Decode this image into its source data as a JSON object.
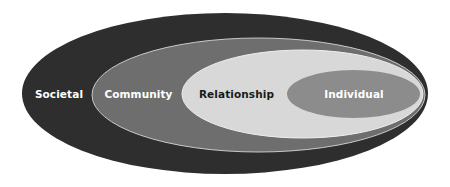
{
  "diagram": {
    "type": "nested-ellipses",
    "levels": [
      {
        "name": "societal",
        "label": "Societal",
        "fill": "#2e2e2e",
        "text_color": "#ffffff",
        "ellipse": {
          "cx": 225,
          "cy": 93.5,
          "rx": 203,
          "ry": 80.5
        },
        "label_pos": {
          "x": 59,
          "y": 97.5
        }
      },
      {
        "name": "community",
        "label": "Community",
        "fill": "#6e6e6e",
        "stroke": "#c8c8c8",
        "text_color": "#ffffff",
        "ellipse": {
          "cx": 258.5,
          "cy": 95,
          "rx": 166.5,
          "ry": 57
        },
        "label_pos": {
          "x": 138.5,
          "y": 97.5
        }
      },
      {
        "name": "relationship",
        "label": "Relationship",
        "fill": "#d8d8d8",
        "stroke": "#eeeeee",
        "text_color": "#1a1a1a",
        "ellipse": {
          "cx": 302.5,
          "cy": 94,
          "rx": 120.5,
          "ry": 44
        },
        "label_pos": {
          "x": 236.5,
          "y": 97.5
        }
      },
      {
        "name": "individual",
        "label": "Individual",
        "fill": "#8c8c8c",
        "text_color": "#ffffff",
        "ellipse": {
          "cx": 353.5,
          "cy": 94,
          "rx": 66.5,
          "ry": 24
        },
        "label_pos": {
          "x": 354,
          "y": 97.5
        }
      }
    ]
  }
}
